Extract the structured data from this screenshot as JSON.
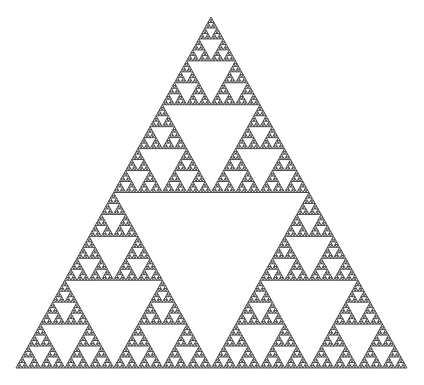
{
  "figure": {
    "title": "Sierpinski triangle",
    "type": "fractal",
    "background": "#ffffff",
    "stroke_color": "#3a3a3a",
    "stroke_width": 0.9,
    "depth": 7,
    "vertices": {
      "apex": [
        211,
        17
      ],
      "bottom_left": [
        16,
        368
      ],
      "bottom_right": [
        407,
        368
      ]
    }
  }
}
